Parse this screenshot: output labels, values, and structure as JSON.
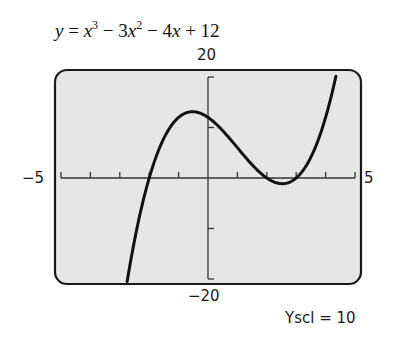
{
  "equation": {
    "lhs": "y",
    "parts": [
      "x",
      "3",
      " − 3",
      "x",
      "2",
      " − 4",
      "x",
      " + 12"
    ],
    "text": "y = x^3 − 3x^2 − 4x + 12"
  },
  "window": {
    "xmin_label": "−5",
    "xmax_label": "5",
    "ymax_label": "20",
    "ymin_label": "−20",
    "yscl_label": "Yscl = 10"
  },
  "colors": {
    "screen_bg": "#e6e6e6",
    "border": "#1a1a1a",
    "curve": "#111111",
    "axis": "#333333"
  },
  "chart_data": {
    "type": "line",
    "function": "x^3 - 3x^2 - 4x + 12",
    "xlabel": "",
    "ylabel": "",
    "xlim": [
      -5,
      5
    ],
    "ylim": [
      -20,
      20
    ],
    "xscl": 1,
    "yscl": 10,
    "grid": false,
    "x_ticks": [
      -4,
      -3,
      -2,
      -1,
      1,
      2,
      3,
      4
    ],
    "y_ticks": [
      -10,
      10
    ],
    "series": [
      {
        "name": "y = x^3 − 3x^2 − 4x + 12",
        "x": [
          -2.75,
          -2.5,
          -2,
          -1.5,
          -1,
          -0.5,
          0,
          0.5,
          1,
          1.5,
          2,
          2.5,
          3,
          3.5,
          4,
          4.35
        ],
        "y": [
          -20.55,
          -12.375,
          0,
          7.875,
          12,
          12.875,
          12,
          9.375,
          6,
          2.625,
          0,
          -1.875,
          0,
          5.625,
          12,
          20.1
        ]
      }
    ],
    "annotations": [
      "Yscl = 10"
    ],
    "zeros": [
      -2,
      2,
      3
    ]
  }
}
